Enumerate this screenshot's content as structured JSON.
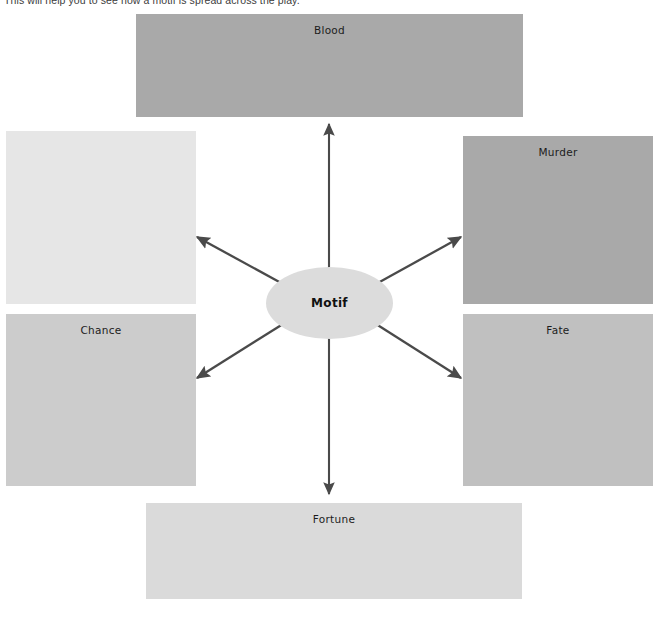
{
  "page": {
    "instruction": "This will help you to see how a motif is spread across the play."
  },
  "diagram": {
    "type": "spider-diagram",
    "center": {
      "label": "Motif",
      "fill": "#dcdcdc",
      "text_color": "#111111"
    },
    "arrow_color": "#4a4a4a",
    "branches": [
      {
        "id": "blood",
        "label": "Blood",
        "fill": "#a9a9a9",
        "direction": "up",
        "position": "top"
      },
      {
        "id": "murder",
        "label": "Murder",
        "fill": "#a9a9a9",
        "direction": "up-right",
        "position": "right-upper"
      },
      {
        "id": "fate",
        "label": "Fate",
        "fill": "#c0c0c0",
        "direction": "down-right",
        "position": "right-lower"
      },
      {
        "id": "fortune",
        "label": "Fortune",
        "fill": "#dadada",
        "direction": "down",
        "position": "bottom"
      },
      {
        "id": "chance",
        "label": "Chance",
        "fill": "#cccccc",
        "direction": "down-left",
        "position": "left-lower"
      },
      {
        "id": "blank",
        "label": "",
        "fill": "#e6e6e6",
        "direction": "up-left",
        "position": "left-upper"
      }
    ]
  }
}
